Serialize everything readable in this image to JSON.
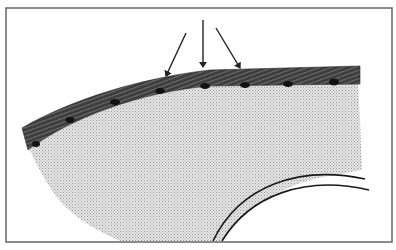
{
  "figure": {
    "arrow_count": 3,
    "embedded_particle_count": 11,
    "colors": {
      "frame": "#555555",
      "coating_band": "#3a3a3a",
      "substrate": "#d4d4d4",
      "particles": "#0e0e0e",
      "arrows": "#222222",
      "arc_lines": "#1a1a1a"
    }
  }
}
